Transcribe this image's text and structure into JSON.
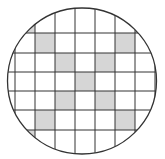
{
  "diagram": {
    "colors": {
      "background": "#ffffff",
      "line": "#333333",
      "shade": "#d6d6d6"
    },
    "circle": {
      "cx": 82,
      "cy": 81,
      "rx": 74.5,
      "ry": 73
    },
    "grid": {
      "vertical_lines": [
        15,
        35,
        55,
        75,
        95,
        115,
        135,
        155
      ],
      "horizontal_lines": [
        13,
        33,
        53,
        72,
        91,
        110,
        130,
        150
      ],
      "columns": [
        [
          8,
          15
        ],
        [
          15,
          35
        ],
        [
          35,
          55
        ],
        [
          55,
          75
        ],
        [
          75,
          95
        ],
        [
          95,
          115
        ],
        [
          115,
          135
        ],
        [
          135,
          155
        ],
        [
          155,
          157
        ]
      ],
      "rows": [
        [
          8,
          33
        ],
        [
          33,
          53
        ],
        [
          53,
          72
        ],
        [
          72,
          91
        ],
        [
          91,
          110
        ],
        [
          110,
          130
        ],
        [
          130,
          154
        ]
      ]
    },
    "shaded_cells": [
      {
        "row": 0,
        "col": 1
      },
      {
        "row": 0,
        "col": 7
      },
      {
        "row": 1,
        "col": 2
      },
      {
        "row": 1,
        "col": 6
      },
      {
        "row": 2,
        "col": 3
      },
      {
        "row": 2,
        "col": 5
      },
      {
        "row": 3,
        "col": 4
      },
      {
        "row": 4,
        "col": 3
      },
      {
        "row": 4,
        "col": 5
      },
      {
        "row": 5,
        "col": 2
      },
      {
        "row": 5,
        "col": 6
      },
      {
        "row": 6,
        "col": 1
      },
      {
        "row": 6,
        "col": 7
      }
    ]
  }
}
